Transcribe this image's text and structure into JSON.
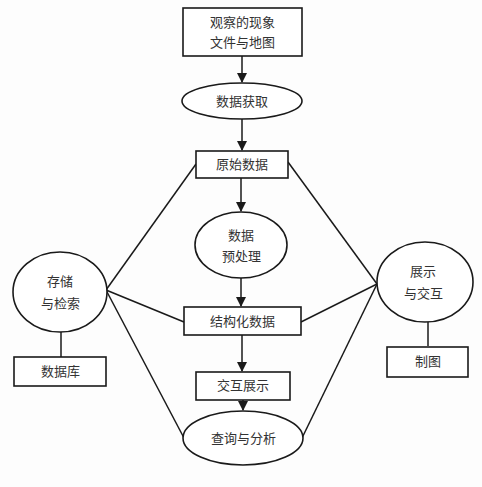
{
  "diagram": {
    "nodes": {
      "observed": {
        "shape": "rect",
        "lines": [
          "观察的现象",
          "文件与地图"
        ]
      },
      "acquire": {
        "shape": "ellipse",
        "lines": [
          "数据获取"
        ]
      },
      "raw": {
        "shape": "rect",
        "lines": [
          "原始数据"
        ]
      },
      "preprocess": {
        "shape": "ellipse",
        "lines": [
          "数据",
          "预处理"
        ]
      },
      "structured": {
        "shape": "rect",
        "lines": [
          "结构化数据"
        ]
      },
      "interactive_display": {
        "shape": "rect",
        "lines": [
          "交互展示"
        ]
      },
      "query": {
        "shape": "ellipse",
        "lines": [
          "查询与分析"
        ]
      },
      "storage": {
        "shape": "ellipse",
        "lines": [
          "存储",
          "与检索"
        ]
      },
      "database": {
        "shape": "rect",
        "lines": [
          "数据库"
        ]
      },
      "display": {
        "shape": "ellipse",
        "lines": [
          "展示",
          "与交互"
        ]
      },
      "mapping": {
        "shape": "rect",
        "lines": [
          "制图"
        ]
      }
    },
    "edges": [
      {
        "from": "observed",
        "to": "acquire",
        "arrow": true
      },
      {
        "from": "acquire",
        "to": "raw",
        "arrow": true
      },
      {
        "from": "raw",
        "to": "preprocess",
        "arrow": true
      },
      {
        "from": "preprocess",
        "to": "structured",
        "arrow": true
      },
      {
        "from": "structured",
        "to": "interactive_display",
        "arrow": true
      },
      {
        "from": "interactive_display",
        "to": "query",
        "arrow": true
      },
      {
        "from": "storage",
        "to": "raw",
        "arrow": false
      },
      {
        "from": "storage",
        "to": "structured",
        "arrow": false
      },
      {
        "from": "storage",
        "to": "query",
        "arrow": false
      },
      {
        "from": "storage",
        "to": "database",
        "arrow": false
      },
      {
        "from": "display",
        "to": "raw",
        "arrow": false
      },
      {
        "from": "display",
        "to": "structured",
        "arrow": false
      },
      {
        "from": "display",
        "to": "query",
        "arrow": false
      },
      {
        "from": "display",
        "to": "mapping",
        "arrow": false
      }
    ]
  }
}
